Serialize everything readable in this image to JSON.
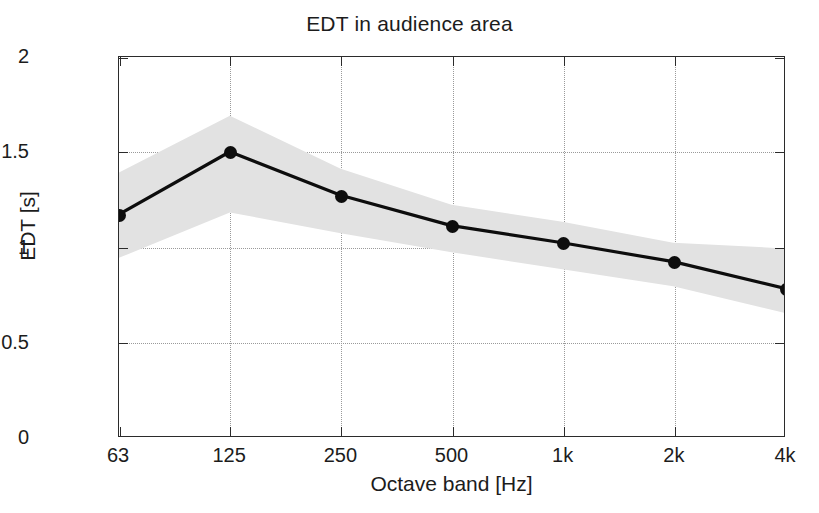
{
  "chart_data": {
    "type": "line",
    "title": "EDT in audience area",
    "xlabel": "Octave band [Hz]",
    "ylabel": "EDT [s]",
    "categories": [
      "63",
      "125",
      "250",
      "500",
      "1k",
      "2k",
      "4k"
    ],
    "values": [
      1.17,
      1.5,
      1.27,
      1.11,
      1.02,
      0.92,
      0.78
    ],
    "series": [
      {
        "name": "EDT mean",
        "values": [
          1.17,
          1.5,
          1.27,
          1.11,
          1.02,
          0.92,
          0.78
        ]
      },
      {
        "name": "EDT spread band (upper)",
        "values": [
          1.39,
          1.69,
          1.41,
          1.22,
          1.13,
          1.02,
          0.99
        ]
      },
      {
        "name": "EDT spread band (lower)",
        "values": [
          0.94,
          1.18,
          1.07,
          0.97,
          0.88,
          0.79,
          0.65
        ]
      }
    ],
    "ylim": [
      0,
      2
    ],
    "yticks": [
      "0",
      "0.5",
      "1",
      "1.5",
      "2"
    ],
    "ytick_values": [
      0,
      0.5,
      1,
      1.5,
      2
    ],
    "xticks": [
      "63",
      "125",
      "250",
      "500",
      "1k",
      "2k",
      "4k"
    ],
    "grid": true,
    "grid_style": "dotted",
    "legend": "none",
    "colors": {
      "line": "#0d0d0d",
      "marker": "#0d0d0d",
      "band": "#e2e2e2",
      "grid": "#9a9a9a",
      "axis": "#2b2b2b",
      "background": "#ffffff",
      "text": "#1c1c1c"
    }
  }
}
